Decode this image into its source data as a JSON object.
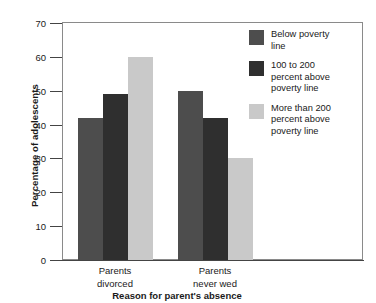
{
  "chart_data": {
    "type": "bar",
    "title": "",
    "xlabel": "Reason for parent's absence",
    "ylabel": "Percentage of adolescents",
    "categories": [
      "Parents divorced",
      "Parents never wed"
    ],
    "category_lines": [
      [
        "Parents",
        "divorced"
      ],
      [
        "Parents",
        "never wed"
      ]
    ],
    "series": [
      {
        "name": "Below poverty line",
        "values": [
          42,
          50
        ],
        "color": "#4d4d4d"
      },
      {
        "name": "100 to 200 percent above poverty line",
        "values": [
          49,
          42
        ],
        "color": "#2f2f2f"
      },
      {
        "name": "More than 200 percent above poverty line",
        "values": [
          60,
          30
        ],
        "color": "#c9c9c9"
      }
    ],
    "ylim": [
      0,
      70
    ],
    "yticks": [
      0,
      10,
      20,
      30,
      40,
      50,
      60,
      70
    ],
    "ytick_labels": [
      "0",
      "10",
      "20",
      "30",
      "40",
      "50",
      "60",
      "70"
    ],
    "grid": false,
    "legend_position": "upper right inside plot",
    "legend_entries": [
      {
        "label": "Below poverty line",
        "lines": [
          "Below poverty",
          "line"
        ],
        "color": "#4d4d4d"
      },
      {
        "label": "100 to 200 percent above poverty line",
        "lines": [
          "100 to 200",
          "percent above",
          "poverty line"
        ],
        "color": "#2f2f2f"
      },
      {
        "label": "More than 200 percent above poverty line",
        "lines": [
          "More than 200",
          "percent above",
          "poverty line"
        ],
        "color": "#c9c9c9"
      }
    ]
  },
  "axes": {
    "y_title": "Percentage of adolescents",
    "x_title": "Reason for parent's absence"
  },
  "colors": {
    "series_1": "#4d4d4d",
    "series_2": "#2f2f2f",
    "series_3": "#c9c9c9",
    "axis": "#444444",
    "frame": "#8a8a8a",
    "background": "#ffffff"
  }
}
